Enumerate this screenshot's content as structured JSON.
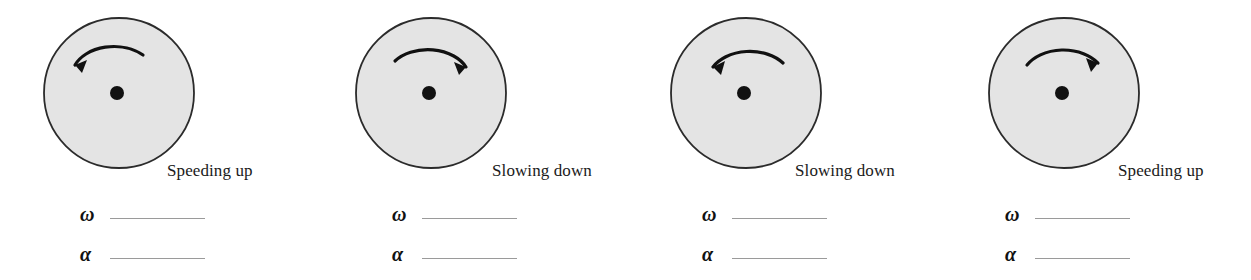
{
  "figure": {
    "background_color": "#ffffff",
    "disk_fill_color": "#e4e4e4",
    "disk_stroke_color": "#2b2b2b",
    "hub_color": "#111111",
    "arrow_color": "#111111",
    "blank_line_color": "#9a9a9a"
  },
  "symbols": {
    "omega": "ω",
    "alpha": "α"
  },
  "panels": [
    {
      "id": "panel-1",
      "state_label": "Speeding up",
      "rotation_direction": "counterclockwise",
      "arrow_head": "left",
      "omega_label": "ω",
      "omega_value": "",
      "alpha_label": "α",
      "alpha_value": ""
    },
    {
      "id": "panel-2",
      "state_label": "Slowing down",
      "rotation_direction": "clockwise",
      "arrow_head": "right",
      "omega_label": "ω",
      "omega_value": "",
      "alpha_label": "α",
      "alpha_value": ""
    },
    {
      "id": "panel-3",
      "state_label": "Slowing down",
      "rotation_direction": "counterclockwise",
      "arrow_head": "left",
      "omega_label": "ω",
      "omega_value": "",
      "alpha_label": "α",
      "alpha_value": ""
    },
    {
      "id": "panel-4",
      "state_label": "Speeding up",
      "rotation_direction": "clockwise",
      "arrow_head": "right",
      "omega_label": "ω",
      "omega_value": "",
      "alpha_label": "α",
      "alpha_value": ""
    }
  ]
}
